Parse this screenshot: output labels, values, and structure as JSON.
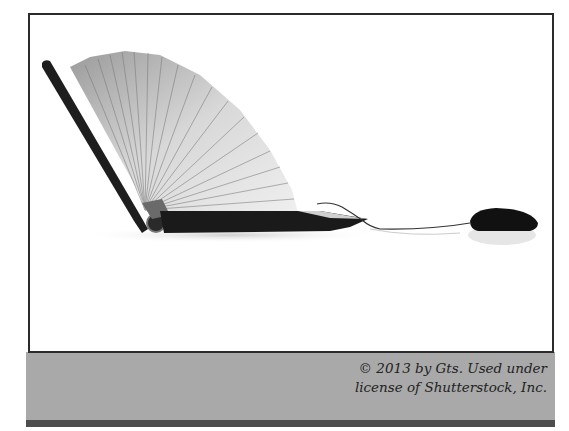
{
  "figure": {
    "illustration_icons": [
      "book-laptop-icon",
      "computer-mouse-icon",
      "mouse-cord-icon"
    ]
  },
  "caption": {
    "line1": "© 2013 by Gts. Used under",
    "line2": "license of Shutterstock, Inc."
  },
  "colors": {
    "frame_border": "#2b2b2b",
    "caption_band": "#a9a9a9",
    "bottom_strip": "#4d4d4d",
    "caption_text": "#222222"
  }
}
